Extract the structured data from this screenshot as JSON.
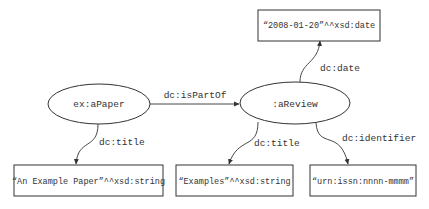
{
  "diagram": {
    "type": "rdf-graph",
    "nodes": [
      {
        "id": "paper",
        "shape": "ellipse",
        "label": "ex:aPaper"
      },
      {
        "id": "review",
        "shape": "ellipse",
        "label": ":aReview"
      },
      {
        "id": "date_lit",
        "shape": "box",
        "label": "“2008-01-20”^^xsd:date"
      },
      {
        "id": "paper_title_lit",
        "shape": "box",
        "label": "“An Example Paper”^^xsd:string"
      },
      {
        "id": "review_title_lit",
        "shape": "box",
        "label": "“Examples”^^xsd:string"
      },
      {
        "id": "identifier_lit",
        "shape": "box",
        "label": "“urn:issn:nnnn-mmmm”"
      }
    ],
    "edges": [
      {
        "from": "paper",
        "to": "review",
        "label": "dc:isPartOf"
      },
      {
        "from": "paper",
        "to": "paper_title_lit",
        "label": "dc:title"
      },
      {
        "from": "review",
        "to": "date_lit",
        "label": "dc:date"
      },
      {
        "from": "review",
        "to": "review_title_lit",
        "label": "dc:title"
      },
      {
        "from": "review",
        "to": "identifier_lit",
        "label": "dc:identifier"
      }
    ]
  }
}
